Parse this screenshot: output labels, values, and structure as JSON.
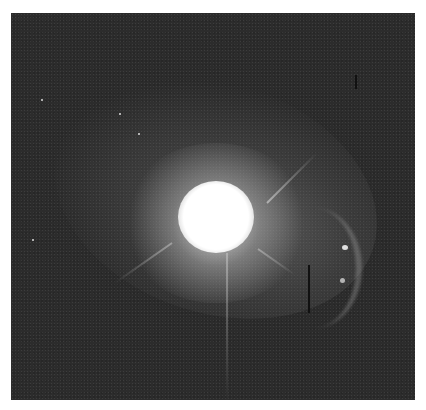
{
  "image": {
    "subject": "bright point source with diffuse halo and faint arc-shaped knots",
    "colors": {
      "background": "#2c2c2c",
      "core": "#ffffff",
      "page": "#ffffff"
    }
  }
}
